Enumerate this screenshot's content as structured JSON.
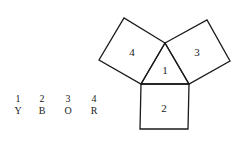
{
  "diagram": {
    "stroke_color": "#1a1a1a",
    "background": "#ffffff",
    "regions": [
      {
        "id": "1",
        "label": "1",
        "shape": "triangle"
      },
      {
        "id": "2",
        "label": "2",
        "shape": "square"
      },
      {
        "id": "3",
        "label": "3",
        "shape": "square"
      },
      {
        "id": "4",
        "label": "4",
        "shape": "square"
      }
    ]
  },
  "legend": {
    "items": [
      {
        "number": "1",
        "letter": "Y"
      },
      {
        "number": "2",
        "letter": "B"
      },
      {
        "number": "3",
        "letter": "O"
      },
      {
        "number": "4",
        "letter": "R"
      }
    ]
  }
}
